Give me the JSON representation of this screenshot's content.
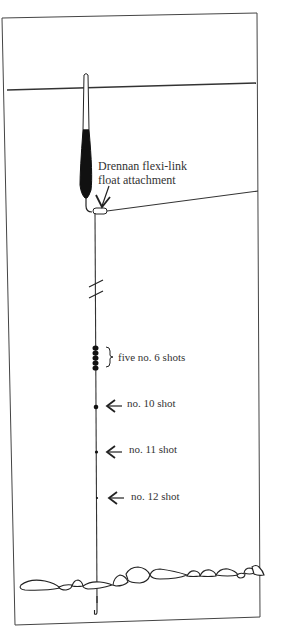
{
  "diagram": {
    "type": "fishing float rig illustration",
    "labels": {
      "flexi_link_line1": "Drennan flexi-link",
      "flexi_link_line2": "float attachment",
      "five_shots": "five no. 6 shots",
      "shot_10": "no. 10 shot",
      "shot_11": "no. 11 shot",
      "shot_12": "no. 12 shot"
    },
    "colors": {
      "ink": "#222222",
      "float_body": "#111111",
      "paper": "#ffffff"
    },
    "elements": [
      "frame",
      "water-surface",
      "float",
      "flexi-link",
      "rod-line",
      "main-line",
      "line-break-mark",
      "bulk-shots",
      "dropper-shots",
      "hook",
      "lakebed-stones"
    ]
  }
}
